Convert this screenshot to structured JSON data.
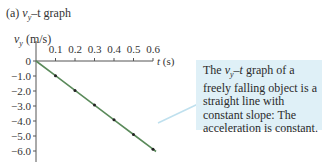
{
  "figure": {
    "panel_label": "(a)",
    "title_var": "v",
    "title_sub": "y",
    "title_rest": "–t graph"
  },
  "callout": {
    "text_lead_var": "v",
    "text_lead_sub": "y",
    "text_lead_dash": "–",
    "text_lead_t": "t",
    "text_rest": " graph of a freely falling object is a straight line with constant slope: The acceleration is constant.",
    "bg_color": "#dff0f7"
  },
  "chart_data": {
    "type": "line",
    "title": "(a) vy–t graph",
    "xlabel": "t (s)",
    "ylabel": "vy (m/s)",
    "x_ticks": [
      "0.1",
      "0.2",
      "0.3",
      "0.4",
      "0.5",
      "0.6"
    ],
    "y_ticks": [
      "0",
      "-1.0",
      "-2.0",
      "-3.0",
      "-4.0",
      "-5.0",
      "-6.0"
    ],
    "xlim": [
      0,
      0.6
    ],
    "ylim": [
      -6.0,
      0
    ],
    "grid": false,
    "series": [
      {
        "name": "vy",
        "x": [
          0,
          0.1,
          0.2,
          0.3,
          0.4,
          0.5,
          0.6
        ],
        "y": [
          0,
          -0.98,
          -1.96,
          -2.94,
          -3.92,
          -4.9,
          -5.88
        ],
        "color": "#5a8a5a"
      }
    ],
    "annotations": [
      "The vy–t graph of a freely falling object is a straight line with constant slope: The acceleration is constant."
    ]
  }
}
